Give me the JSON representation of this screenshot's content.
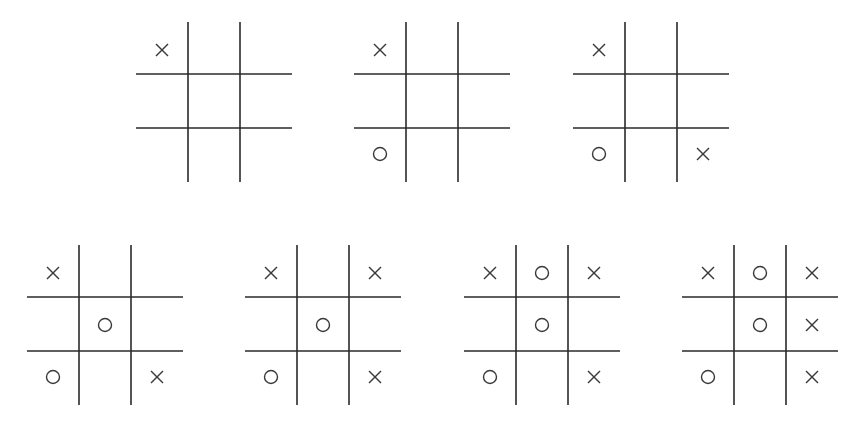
{
  "diagram": {
    "title": "",
    "colors": {
      "line": "#2a2a2a",
      "mark": "#3a3a3a",
      "background": "#ffffff"
    },
    "boards": [
      {
        "id": 1,
        "left": 136,
        "top": 22,
        "cells": [
          "X",
          "",
          "",
          "",
          "",
          "",
          "",
          "",
          ""
        ]
      },
      {
        "id": 2,
        "left": 354,
        "top": 22,
        "cells": [
          "X",
          "",
          "",
          "",
          "",
          "",
          "O",
          "",
          ""
        ]
      },
      {
        "id": 3,
        "left": 573,
        "top": 22,
        "cells": [
          "X",
          "",
          "",
          "",
          "",
          "",
          "O",
          "",
          "X"
        ]
      },
      {
        "id": 4,
        "left": 27,
        "top": 245,
        "cells": [
          "X",
          "",
          "",
          "",
          "O",
          "",
          "O",
          "",
          "X"
        ]
      },
      {
        "id": 5,
        "left": 245,
        "top": 245,
        "cells": [
          "X",
          "",
          "X",
          "",
          "O",
          "",
          "O",
          "",
          "X"
        ]
      },
      {
        "id": 6,
        "left": 464,
        "top": 245,
        "cells": [
          "X",
          "O",
          "X",
          "",
          "O",
          "",
          "O",
          "",
          "X"
        ]
      },
      {
        "id": 7,
        "left": 682,
        "top": 245,
        "cells": [
          "X",
          "O",
          "X",
          "",
          "O",
          "X",
          "O",
          "",
          "X"
        ]
      }
    ]
  }
}
